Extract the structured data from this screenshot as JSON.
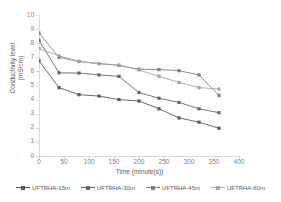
{
  "chart_data": {
    "type": "line",
    "title": "",
    "xlabel": "Time (minute(s))",
    "ylabel": "Conductivity level (mS/cm)",
    "xlim": [
      0,
      400
    ],
    "ylim": [
      0,
      10
    ],
    "xticks": [
      0,
      50,
      100,
      150,
      200,
      250,
      300,
      350,
      400
    ],
    "yticks": [
      0,
      1,
      2,
      3,
      4,
      5,
      6,
      7,
      8,
      9,
      10
    ],
    "grid": false,
    "legend_position": "bottom",
    "marker": "square",
    "x": [
      0,
      40,
      80,
      120,
      160,
      200,
      240,
      280,
      320,
      360
    ],
    "series": [
      {
        "name": "UFTRHA-15m",
        "color": "#595959",
        "values": [
          6.75,
          4.85,
          4.35,
          4.25,
          4.0,
          3.9,
          3.35,
          2.7,
          2.4,
          1.97
        ]
      },
      {
        "name": "UFTRHA-30m",
        "color": "#666666",
        "values": [
          8.2,
          5.9,
          5.88,
          5.75,
          5.65,
          4.5,
          4.1,
          3.8,
          3.35,
          3.07
        ]
      },
      {
        "name": "UFTRHA-45m",
        "color": "#808080",
        "values": [
          8.72,
          7.0,
          6.7,
          6.55,
          6.42,
          6.15,
          6.13,
          6.05,
          5.75,
          4.3
        ]
      },
      {
        "name": "UFTRHA-60m",
        "color": "#a6a6a6",
        "values": [
          7.62,
          7.1,
          6.72,
          6.55,
          6.45,
          6.1,
          5.65,
          5.22,
          4.85,
          4.75
        ]
      }
    ]
  }
}
